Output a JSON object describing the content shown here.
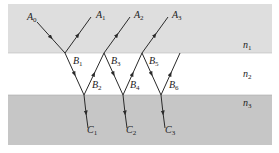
{
  "diagram": {
    "type": "multiple-beam reflection/refraction in thin film",
    "colors": {
      "medium_n1": "#dedede",
      "medium_n2": "#ffffff",
      "medium_n3": "#c6c6c6",
      "ray": "#2a2a2a"
    },
    "media": [
      {
        "id": "n1",
        "base": "n",
        "sub": "1"
      },
      {
        "id": "n2",
        "base": "n",
        "sub": "2"
      },
      {
        "id": "n3",
        "base": "n",
        "sub": "3"
      }
    ],
    "points": {
      "A0": {
        "base": "A",
        "sub": "0"
      },
      "A1": {
        "base": "A",
        "sub": "1"
      },
      "A2": {
        "base": "A",
        "sub": "2"
      },
      "A3": {
        "base": "A",
        "sub": "3"
      },
      "B1": {
        "base": "B",
        "sub": "1"
      },
      "B2": {
        "base": "B",
        "sub": "2"
      },
      "B3": {
        "base": "B",
        "sub": "3"
      },
      "B4": {
        "base": "B",
        "sub": "4"
      },
      "B5": {
        "base": "B",
        "sub": "5"
      },
      "B6": {
        "base": "B",
        "sub": "6"
      },
      "C1": {
        "base": "C",
        "sub": "1"
      },
      "C2": {
        "base": "C",
        "sub": "2"
      },
      "C3": {
        "base": "C",
        "sub": "3"
      }
    }
  },
  "caption": ""
}
